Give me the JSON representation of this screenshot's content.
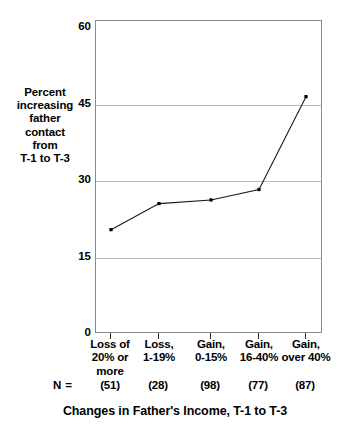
{
  "chart_data": {
    "type": "line",
    "title": "",
    "subtitle": "",
    "xlabel": "Changes in Father's Income, T-1 to T-3",
    "ylabel": "Percent increasing father contact from T-1 to T-3",
    "ylabel_lines": [
      "Percent",
      "increasing",
      "father",
      "contact",
      "from",
      "T-1 to T-3"
    ],
    "categories": [
      "Loss of 20% or more",
      "Loss, 1-19%",
      "Gain, 0-15%",
      "Gain, 16-40%",
      "Gain, over 40%"
    ],
    "category_lines": [
      [
        "Loss of",
        "20% or",
        "more"
      ],
      [
        "Loss,",
        "1-19%"
      ],
      [
        "Gain,",
        "0-15%"
      ],
      [
        "Gain,",
        "16-40%"
      ],
      [
        "Gain,",
        "over 40%"
      ]
    ],
    "values": [
      20,
      25,
      25.7,
      27.7,
      45.5
    ],
    "n_label": "N =",
    "n_values": [
      "(51)",
      "(28)",
      "(98)",
      "(77)",
      "(87)"
    ],
    "ylim": [
      0,
      60
    ],
    "yticks": [
      0,
      15,
      30,
      45,
      60
    ],
    "ytick_labels": [
      "0",
      "15",
      "30",
      "45",
      "60"
    ],
    "grid": true,
    "grid_axis": "y",
    "legend": false,
    "legend_position": "none",
    "marker": "square",
    "line_color": "#1a1a1a",
    "marker_color": "#000000",
    "grid_color": "#b9b9b9",
    "frame_color": "#8a8a8a",
    "background": "#ffffff"
  }
}
